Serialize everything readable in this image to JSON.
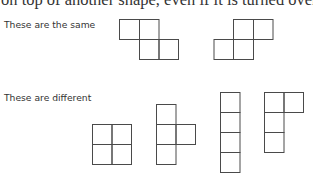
{
  "intro_text": "on top of another shape, even if it is turned over.",
  "sections": {
    "same": {
      "label": "These are the same"
    },
    "different": {
      "label": "These are different"
    }
  },
  "shapes": {
    "same": [
      {
        "name": "z-tetromino",
        "cells": [
          [
            0,
            0
          ],
          [
            1,
            0
          ],
          [
            1,
            1
          ],
          [
            2,
            1
          ]
        ]
      },
      {
        "name": "s-tetromino",
        "cells": [
          [
            1,
            0
          ],
          [
            2,
            0
          ],
          [
            0,
            1
          ],
          [
            1,
            1
          ]
        ]
      }
    ],
    "different": [
      {
        "name": "square-tetromino",
        "cells": [
          [
            0,
            0
          ],
          [
            1,
            0
          ],
          [
            0,
            1
          ],
          [
            1,
            1
          ]
        ]
      },
      {
        "name": "t-tetromino",
        "cells": [
          [
            0,
            0
          ],
          [
            0,
            1
          ],
          [
            1,
            1
          ],
          [
            0,
            2
          ]
        ]
      },
      {
        "name": "i-tetromino",
        "cells": [
          [
            0,
            0
          ],
          [
            0,
            1
          ],
          [
            0,
            2
          ],
          [
            0,
            3
          ]
        ]
      },
      {
        "name": "l-tetromino",
        "cells": [
          [
            0,
            0
          ],
          [
            1,
            0
          ],
          [
            0,
            1
          ],
          [
            0,
            2
          ]
        ]
      }
    ]
  },
  "colors": {
    "stroke": "#4a4a4a",
    "text": "#333333",
    "background": "#ffffff"
  }
}
